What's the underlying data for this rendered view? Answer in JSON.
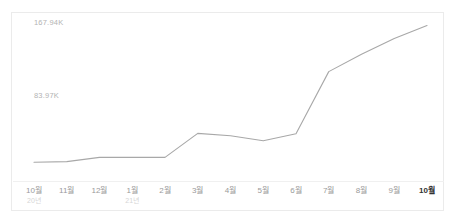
{
  "chart_data": {
    "type": "line",
    "title": "",
    "xlabel": "",
    "ylabel": "",
    "grid": false,
    "legend": null,
    "ylim": [
      0,
      167940
    ],
    "y_ticks": [
      {
        "value": 167940,
        "label": "167.94K"
      },
      {
        "value": 83970,
        "label": "83.97K"
      }
    ],
    "categories": [
      "10월",
      "11월",
      "12월",
      "1월",
      "2월",
      "3월",
      "4월",
      "5월",
      "6월",
      "7월",
      "8월",
      "9월",
      "10월"
    ],
    "year_markers": [
      {
        "index": 0,
        "label": "20년"
      },
      {
        "index": 3,
        "label": "21년"
      }
    ],
    "selected_index": 12,
    "series": [
      {
        "name": "",
        "color": "#a8a8a8",
        "values": [
          7800,
          8500,
          13400,
          13400,
          13400,
          41000,
          38200,
          32400,
          40500,
          112000,
          132000,
          150000,
          165000
        ]
      }
    ]
  },
  "axis_labels": {
    "y_top": "167.94K",
    "y_mid": "83.97K"
  },
  "x_axis": {
    "ticks": [
      {
        "month": "10월",
        "year": "20년"
      },
      {
        "month": "11월",
        "year": ""
      },
      {
        "month": "12월",
        "year": ""
      },
      {
        "month": "1월",
        "year": "21년"
      },
      {
        "month": "2월",
        "year": ""
      },
      {
        "month": "3월",
        "year": ""
      },
      {
        "month": "4월",
        "year": ""
      },
      {
        "month": "5월",
        "year": ""
      },
      {
        "month": "6월",
        "year": ""
      },
      {
        "month": "7월",
        "year": ""
      },
      {
        "month": "8월",
        "year": ""
      },
      {
        "month": "9월",
        "year": ""
      },
      {
        "month": "10월",
        "year": ""
      }
    ]
  },
  "colors": {
    "line": "#a8a8a8",
    "card_border": "#ebebeb",
    "separator": "#f0f0f0",
    "label_muted": "#b3b3b3",
    "label_selected": "#333333"
  }
}
